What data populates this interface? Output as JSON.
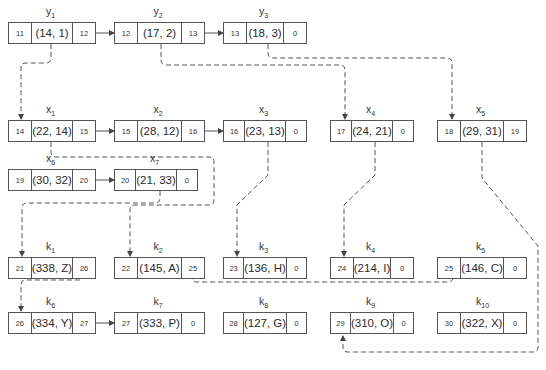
{
  "diagram": {
    "type": "linked-lists",
    "line_color": "#555555",
    "nodes": [
      {
        "id": "y1",
        "name": "y",
        "sub": "1",
        "addr": "11",
        "value": "(14, 1)",
        "next": "12"
      },
      {
        "id": "y2",
        "name": "y",
        "sub": "2",
        "addr": "12",
        "value": "(17, 2)",
        "next": "13"
      },
      {
        "id": "y3",
        "name": "y",
        "sub": "3",
        "addr": "13",
        "value": "(18, 3)",
        "next": "0"
      },
      {
        "id": "x1",
        "name": "x",
        "sub": "1",
        "addr": "14",
        "value": "(22, 14)",
        "next": "15"
      },
      {
        "id": "x2",
        "name": "x",
        "sub": "2",
        "addr": "15",
        "value": "(28, 12)",
        "next": "16"
      },
      {
        "id": "x3",
        "name": "x",
        "sub": "3",
        "addr": "16",
        "value": "(23, 13)",
        "next": "0"
      },
      {
        "id": "x4",
        "name": "x",
        "sub": "4",
        "addr": "17",
        "value": "(24, 21)",
        "next": "0"
      },
      {
        "id": "x5",
        "name": "x",
        "sub": "5",
        "addr": "18",
        "value": "(29, 31)",
        "next": "19"
      },
      {
        "id": "x6",
        "name": "x",
        "sub": "6",
        "addr": "19",
        "value": "(30, 32)",
        "next": "20"
      },
      {
        "id": "x7",
        "name": "x",
        "sub": "7",
        "addr": "20",
        "value": "(21, 33)",
        "next": "0"
      },
      {
        "id": "k1",
        "name": "k",
        "sub": "1",
        "addr": "21",
        "value": "(338, Z)",
        "next": "26"
      },
      {
        "id": "k2",
        "name": "k",
        "sub": "2",
        "addr": "22",
        "value": "(145, A)",
        "next": "25"
      },
      {
        "id": "k3",
        "name": "k",
        "sub": "3",
        "addr": "23",
        "value": "(136, H)",
        "next": "0"
      },
      {
        "id": "k4",
        "name": "k",
        "sub": "4",
        "addr": "24",
        "value": "(214, I)",
        "next": "0"
      },
      {
        "id": "k5",
        "name": "k",
        "sub": "5",
        "addr": "25",
        "value": "(146, C)",
        "next": "0"
      },
      {
        "id": "k6",
        "name": "k",
        "sub": "6",
        "addr": "26",
        "value": "(334, Y)",
        "next": "27"
      },
      {
        "id": "k7",
        "name": "k",
        "sub": "7",
        "addr": "27",
        "value": "(333, P)",
        "next": "0"
      },
      {
        "id": "k8",
        "name": "k",
        "sub": "8",
        "addr": "28",
        "value": "(127, G)",
        "next": "0"
      },
      {
        "id": "k9",
        "name": "k",
        "sub": "9",
        "addr": "29",
        "value": "(310, O)",
        "next": "0"
      },
      {
        "id": "k10",
        "name": "k",
        "sub": "10",
        "addr": "30",
        "value": "(322, X)",
        "next": "0"
      }
    ],
    "solid_links": [
      [
        "y1",
        "y2"
      ],
      [
        "y2",
        "y3"
      ],
      [
        "x1",
        "x2"
      ],
      [
        "x2",
        "x3"
      ],
      [
        "x6",
        "x7"
      ],
      [
        "k6",
        "k7"
      ]
    ],
    "dashed_links": [
      [
        "y1",
        "x1"
      ],
      [
        "y2",
        "x4"
      ],
      [
        "y3",
        "x5"
      ],
      [
        "x1",
        "k2"
      ],
      [
        "x3",
        "k3"
      ],
      [
        "x4",
        "k4"
      ],
      [
        "x5",
        "k9"
      ],
      [
        "x7",
        "k1"
      ],
      [
        "k1",
        "k6"
      ],
      [
        "k2",
        "k5"
      ]
    ]
  }
}
